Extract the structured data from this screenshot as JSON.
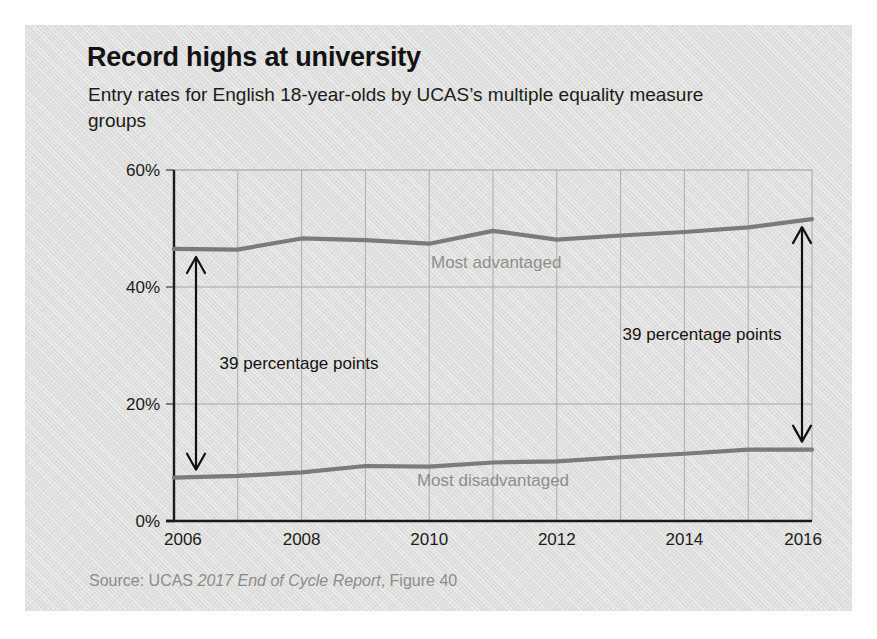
{
  "figure": {
    "title": "Record highs at university",
    "subtitle": "Entry rates for English 18-year-olds by UCAS’s multiple equality measure groups",
    "source_prefix": "Source: UCAS ",
    "source_italic": "2017 End of Cycle Report",
    "source_suffix": ", Figure 40"
  },
  "chart_data": {
    "type": "line",
    "title": "Record highs at university",
    "subtitle": "Entry rates for English 18-year-olds by UCAS’s multiple equality measure groups",
    "xlabel": "",
    "ylabel": "",
    "x": [
      2006,
      2007,
      2008,
      2009,
      2010,
      2011,
      2012,
      2013,
      2014,
      2015,
      2016
    ],
    "xlim": [
      2006,
      2016
    ],
    "ylim": [
      0,
      60
    ],
    "x_tick_labels": [
      "2006",
      "2008",
      "2010",
      "2012",
      "2014",
      "2016"
    ],
    "x_ticks": [
      2006,
      2008,
      2010,
      2012,
      2014,
      2016
    ],
    "y_tick_labels": [
      "0%",
      "20%",
      "40%",
      "60%"
    ],
    "y_ticks": [
      0,
      20,
      40,
      60
    ],
    "grid": true,
    "legend_position": "inline-labels",
    "series": [
      {
        "name": "Most advantaged",
        "color": "#7b7b7b",
        "values": [
          46.5,
          46.4,
          48.3,
          48.0,
          47.4,
          49.6,
          48.1,
          48.8,
          49.4,
          50.2,
          51.6
        ]
      },
      {
        "name": "Most disadvantaged",
        "color": "#7b7b7b",
        "values": [
          7.4,
          7.7,
          8.3,
          9.4,
          9.3,
          10.0,
          10.2,
          10.9,
          11.5,
          12.2,
          12.2
        ]
      }
    ],
    "annotations": [
      {
        "id": "left-gap",
        "text": "39 percentage points",
        "at_x": 2006,
        "from_y": 7.4,
        "to_y": 46.5,
        "style": "double-arrow"
      },
      {
        "id": "right-gap",
        "text": "39 percentage points",
        "at_x": 2016,
        "from_y": 12.2,
        "to_y": 51.6,
        "style": "double-arrow"
      }
    ]
  }
}
